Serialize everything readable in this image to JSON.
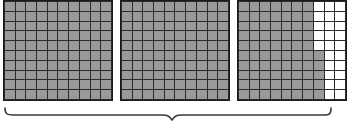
{
  "diagram": {
    "type": "area-model-hundreds-grids",
    "grid_rows": 10,
    "grid_cols": 10,
    "cells_per_grid": 100,
    "shaded_color": "#9a9a9a",
    "unshaded_color": "#ffffff",
    "gridline_color": "#2b2b2b",
    "border_color": "#1a1a1a",
    "background_color": "#ffffff",
    "total_shaded": 275,
    "grids": [
      {
        "name": "grid-1",
        "shaded_count": 100,
        "fully_shaded": true,
        "shaded_per_row": [
          10,
          10,
          10,
          10,
          10,
          10,
          10,
          10,
          10,
          10
        ]
      },
      {
        "name": "grid-2",
        "shaded_count": 100,
        "fully_shaded": true,
        "shaded_per_row": [
          10,
          10,
          10,
          10,
          10,
          10,
          10,
          10,
          10,
          10
        ]
      },
      {
        "name": "grid-3",
        "shaded_count": 75,
        "fully_shaded": false,
        "shaded_per_row": [
          7,
          7,
          7,
          7,
          7,
          8,
          8,
          8,
          8,
          8
        ]
      }
    ],
    "brace": {
      "name": "bottom-brace",
      "orientation": "down",
      "spans_grids": [
        "grid-1",
        "grid-2",
        "grid-3"
      ],
      "label": "",
      "color": "#3a3a3a"
    }
  }
}
